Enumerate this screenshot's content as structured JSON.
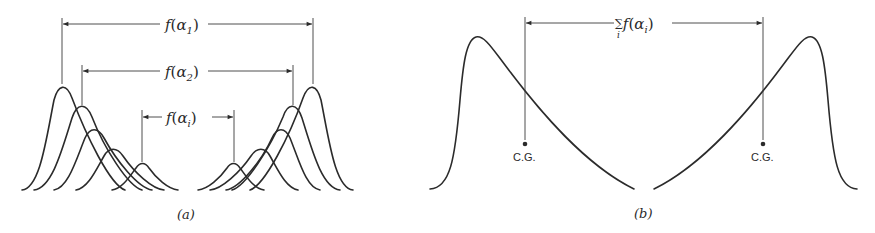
{
  "figure": {
    "panel_a": {
      "label": "(a)",
      "dimensions": [
        {
          "func": "f",
          "symbol": "α",
          "subscript": "1"
        },
        {
          "func": "f",
          "symbol": "α",
          "subscript": "2"
        },
        {
          "func": "f",
          "symbol": "α",
          "subscript": "i"
        }
      ]
    },
    "panel_b": {
      "label": "(b)",
      "dimension": {
        "sum": "∑",
        "sum_index": "i",
        "func": "f",
        "symbol": "α",
        "subscript": "i"
      },
      "cg_left": "C.G.",
      "cg_right": "C.G."
    }
  }
}
